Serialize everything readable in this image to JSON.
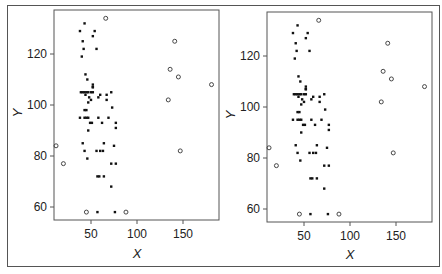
{
  "figure": {
    "panels": [
      "left",
      "right"
    ]
  },
  "chart_data": [
    {
      "type": "scatter",
      "title": "",
      "xlabel": "X",
      "ylabel": "Y",
      "xlim": [
        5,
        185
      ],
      "ylim": [
        55,
        136
      ],
      "xticks": [
        50,
        100,
        150
      ],
      "yticks": [
        60,
        80,
        100,
        120
      ],
      "grid": false,
      "legend": null,
      "series": [
        {
          "name": "filled",
          "marker": "filled-dot",
          "points": [
            [
              43,
              132
            ],
            [
              38,
              129
            ],
            [
              54,
              129
            ],
            [
              52,
              127
            ],
            [
              41,
              125
            ],
            [
              42,
              122
            ],
            [
              56,
              122
            ],
            [
              40,
              119
            ],
            [
              44,
              112
            ],
            [
              46,
              110
            ],
            [
              52,
              108
            ],
            [
              52,
              107
            ],
            [
              52,
              107
            ],
            [
              41,
              105
            ],
            [
              43,
              105
            ],
            [
              45,
              105
            ],
            [
              39,
              105
            ],
            [
              47,
              105
            ],
            [
              50,
              105
            ],
            [
              52,
              105
            ],
            [
              67,
              104
            ],
            [
              72,
              105
            ],
            [
              44,
              104
            ],
            [
              48,
              103
            ],
            [
              58,
              103
            ],
            [
              60,
              104
            ],
            [
              67,
              102
            ],
            [
              50,
              102
            ],
            [
              47,
              101
            ],
            [
              73,
              99
            ],
            [
              43,
              98
            ],
            [
              45,
              98
            ],
            [
              38,
              95
            ],
            [
              43,
              95
            ],
            [
              45,
              95
            ],
            [
              47,
              95
            ],
            [
              58,
              95
            ],
            [
              69,
              95
            ],
            [
              49,
              93
            ],
            [
              51,
              93
            ],
            [
              62,
              93
            ],
            [
              77,
              93
            ],
            [
              47,
              90
            ],
            [
              77,
              91
            ],
            [
              41,
              85
            ],
            [
              64,
              85
            ],
            [
              43,
              82
            ],
            [
              56,
              82
            ],
            [
              60,
              82
            ],
            [
              63,
              82
            ],
            [
              75,
              84
            ],
            [
              46,
              79
            ],
            [
              72,
              77
            ],
            [
              77,
              77
            ],
            [
              57,
              72
            ],
            [
              59,
              72
            ],
            [
              64,
              72
            ],
            [
              72,
              68
            ],
            [
              57,
              58
            ],
            [
              76,
              58
            ]
          ]
        },
        {
          "name": "open",
          "marker": "open-circle",
          "points": [
            [
              66,
              134
            ],
            [
              141,
              125
            ],
            [
              136,
              114
            ],
            [
              145,
              111
            ],
            [
              134,
              102
            ],
            [
              181,
              108
            ],
            [
              12,
              84
            ],
            [
              20,
              77
            ],
            [
              147,
              82
            ],
            [
              45,
              58
            ],
            [
              88,
              58
            ]
          ]
        }
      ]
    },
    {
      "type": "scatter",
      "title": "",
      "xlabel": "X",
      "ylabel": "Y",
      "xlim": [
        5,
        185
      ],
      "ylim": [
        55,
        136
      ],
      "xticks": [
        50,
        100,
        150
      ],
      "yticks": [
        60,
        80,
        100,
        120
      ],
      "grid": false,
      "legend": null,
      "series": [
        {
          "name": "filled",
          "marker": "filled-dot",
          "points": [
            [
              43,
              132
            ],
            [
              38,
              129
            ],
            [
              54,
              129
            ],
            [
              52,
              127
            ],
            [
              41,
              125
            ],
            [
              42,
              122
            ],
            [
              56,
              122
            ],
            [
              40,
              119
            ],
            [
              44,
              112
            ],
            [
              46,
              110
            ],
            [
              52,
              108
            ],
            [
              52,
              107
            ],
            [
              52,
              107
            ],
            [
              41,
              105
            ],
            [
              43,
              105
            ],
            [
              45,
              105
            ],
            [
              39,
              105
            ],
            [
              47,
              105
            ],
            [
              50,
              105
            ],
            [
              52,
              105
            ],
            [
              67,
              104
            ],
            [
              72,
              105
            ],
            [
              44,
              104
            ],
            [
              48,
              103
            ],
            [
              58,
              103
            ],
            [
              60,
              104
            ],
            [
              67,
              102
            ],
            [
              50,
              102
            ],
            [
              47,
              101
            ],
            [
              73,
              99
            ],
            [
              43,
              98
            ],
            [
              45,
              98
            ],
            [
              38,
              95
            ],
            [
              43,
              95
            ],
            [
              45,
              95
            ],
            [
              47,
              95
            ],
            [
              58,
              95
            ],
            [
              69,
              95
            ],
            [
              49,
              93
            ],
            [
              51,
              93
            ],
            [
              62,
              93
            ],
            [
              77,
              93
            ],
            [
              47,
              90
            ],
            [
              77,
              91
            ],
            [
              41,
              85
            ],
            [
              64,
              85
            ],
            [
              43,
              82
            ],
            [
              56,
              82
            ],
            [
              60,
              82
            ],
            [
              63,
              82
            ],
            [
              75,
              84
            ],
            [
              46,
              79
            ],
            [
              72,
              77
            ],
            [
              77,
              77
            ],
            [
              57,
              72
            ],
            [
              59,
              72
            ],
            [
              64,
              72
            ],
            [
              72,
              68
            ],
            [
              57,
              58
            ],
            [
              76,
              58
            ]
          ]
        },
        {
          "name": "open",
          "marker": "open-circle",
          "points": [
            [
              66,
              134
            ],
            [
              141,
              125
            ],
            [
              136,
              114
            ],
            [
              145,
              111
            ],
            [
              134,
              102
            ],
            [
              181,
              108
            ],
            [
              12,
              84
            ],
            [
              20,
              77
            ],
            [
              147,
              82
            ],
            [
              45,
              58
            ],
            [
              88,
              58
            ]
          ]
        }
      ]
    }
  ],
  "labels": {
    "left": {
      "xlabel": "X",
      "ylabel": "Y",
      "xticks": [
        "50",
        "100",
        "150"
      ],
      "yticks": [
        "120",
        "100",
        "80",
        "60"
      ]
    },
    "right": {
      "xlabel": "X",
      "ylabel": "Y",
      "xticks": [
        "50",
        "100",
        "150"
      ],
      "yticks": [
        "120",
        "100",
        "80",
        "60"
      ]
    }
  },
  "colors": {
    "ink": "#222222",
    "frame": "#555555"
  }
}
